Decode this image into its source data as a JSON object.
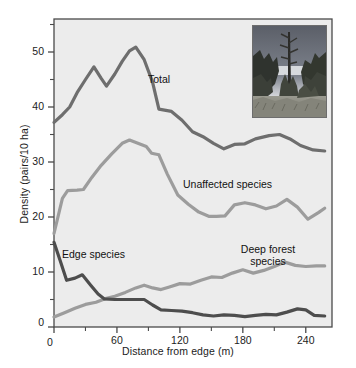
{
  "figure": {
    "background_color": "#ffffff",
    "plot_background_color": "#ececec",
    "frame_color": "#4a4a4a"
  },
  "axes": {
    "y_title": "Density (pairs/10 ha)",
    "x_title": "Distance from edge (m)",
    "y_ticks": [
      0,
      10,
      20,
      30,
      40,
      50
    ],
    "y_tick_labels": [
      "0",
      "10",
      "20",
      "30",
      "40",
      "50"
    ],
    "y_minor_ticks": [
      5,
      15,
      25,
      35,
      45,
      55
    ],
    "x_ticks": [
      0,
      60,
      120,
      180,
      240
    ],
    "x_tick_labels": [
      "0",
      "60",
      "120",
      "180",
      "240"
    ],
    "x_minor_ticks": [
      30,
      90,
      150,
      210
    ],
    "ylim": [
      0,
      56
    ],
    "xlim": [
      0,
      265
    ]
  },
  "series_labels": {
    "total": "Total",
    "unaffected": "Unaffected species",
    "deep_forest_line1": "Deep forest",
    "deep_forest_line2": "species",
    "edge": "Edge species"
  },
  "inset": {
    "name": "forest-edge-photograph",
    "description": "Black and white photograph of a forest edge with a tall dead snag tree"
  },
  "chart_data": {
    "type": "line",
    "title": "",
    "xlabel": "Distance from edge (m)",
    "ylabel": "Density (pairs/10 ha)",
    "xlim": [
      0,
      265
    ],
    "ylim": [
      0,
      56
    ],
    "grid": false,
    "legend": "inline-labels",
    "series": [
      {
        "name": "Total",
        "color": "#6e6e6e",
        "width": 3.2,
        "points": [
          [
            0,
            37.2
          ],
          [
            8,
            38.6
          ],
          [
            15,
            40.0
          ],
          [
            22,
            42.6
          ],
          [
            30,
            45.0
          ],
          [
            38,
            47.3
          ],
          [
            45,
            45.2
          ],
          [
            50,
            43.8
          ],
          [
            58,
            46.0
          ],
          [
            65,
            48.3
          ],
          [
            72,
            50.2
          ],
          [
            78,
            50.9
          ],
          [
            86,
            48.6
          ],
          [
            94,
            44.5
          ],
          [
            100,
            39.6
          ],
          [
            112,
            39.2
          ],
          [
            122,
            37.6
          ],
          [
            132,
            35.5
          ],
          [
            142,
            34.6
          ],
          [
            152,
            33.4
          ],
          [
            162,
            32.4
          ],
          [
            172,
            33.2
          ],
          [
            182,
            33.3
          ],
          [
            192,
            34.2
          ],
          [
            205,
            34.8
          ],
          [
            215,
            35.0
          ],
          [
            225,
            34.2
          ],
          [
            235,
            33.0
          ],
          [
            247,
            32.2
          ],
          [
            258,
            32.0
          ]
        ]
      },
      {
        "name": "Unaffected species",
        "color": "#9c9c9c",
        "width": 3.2,
        "points": [
          [
            0,
            17.0
          ],
          [
            8,
            23.4
          ],
          [
            13,
            24.8
          ],
          [
            22,
            24.9
          ],
          [
            28,
            25.0
          ],
          [
            36,
            27.2
          ],
          [
            45,
            29.4
          ],
          [
            55,
            31.5
          ],
          [
            65,
            33.4
          ],
          [
            72,
            34.0
          ],
          [
            80,
            33.4
          ],
          [
            88,
            32.8
          ],
          [
            93,
            31.6
          ],
          [
            100,
            31.3
          ],
          [
            108,
            27.8
          ],
          [
            118,
            24.0
          ],
          [
            128,
            22.3
          ],
          [
            138,
            20.9
          ],
          [
            148,
            20.1
          ],
          [
            155,
            20.1
          ],
          [
            163,
            20.2
          ],
          [
            172,
            22.2
          ],
          [
            182,
            22.6
          ],
          [
            192,
            22.2
          ],
          [
            202,
            21.5
          ],
          [
            212,
            22.0
          ],
          [
            222,
            23.2
          ],
          [
            232,
            21.8
          ],
          [
            242,
            19.6
          ],
          [
            252,
            20.8
          ],
          [
            258,
            21.6
          ]
        ]
      },
      {
        "name": "Deep forest species",
        "color": "#9c9c9c",
        "width": 3.2,
        "points": [
          [
            0,
            1.8
          ],
          [
            10,
            2.6
          ],
          [
            20,
            3.4
          ],
          [
            30,
            4.1
          ],
          [
            40,
            4.5
          ],
          [
            48,
            5.1
          ],
          [
            58,
            5.6
          ],
          [
            68,
            6.3
          ],
          [
            78,
            7.1
          ],
          [
            86,
            7.6
          ],
          [
            94,
            7.1
          ],
          [
            102,
            6.8
          ],
          [
            110,
            7.3
          ],
          [
            120,
            7.9
          ],
          [
            130,
            7.8
          ],
          [
            140,
            8.5
          ],
          [
            150,
            9.1
          ],
          [
            160,
            9.0
          ],
          [
            170,
            9.8
          ],
          [
            180,
            10.4
          ],
          [
            190,
            9.8
          ],
          [
            200,
            10.3
          ],
          [
            210,
            11.0
          ],
          [
            220,
            11.8
          ],
          [
            230,
            11.2
          ],
          [
            240,
            11.0
          ],
          [
            250,
            11.1
          ],
          [
            258,
            11.1
          ]
        ]
      },
      {
        "name": "Edge species",
        "color": "#4d4d4d",
        "width": 3.2,
        "points": [
          [
            0,
            15.4
          ],
          [
            6,
            12.0
          ],
          [
            12,
            8.5
          ],
          [
            20,
            8.9
          ],
          [
            27,
            9.5
          ],
          [
            35,
            7.6
          ],
          [
            42,
            6.0
          ],
          [
            48,
            5.1
          ],
          [
            58,
            5.0
          ],
          [
            68,
            5.0
          ],
          [
            78,
            5.0
          ],
          [
            86,
            5.0
          ],
          [
            94,
            4.0
          ],
          [
            102,
            3.1
          ],
          [
            112,
            3.0
          ],
          [
            122,
            2.9
          ],
          [
            132,
            2.6
          ],
          [
            142,
            2.2
          ],
          [
            152,
            2.0
          ],
          [
            162,
            2.2
          ],
          [
            172,
            2.1
          ],
          [
            182,
            1.9
          ],
          [
            192,
            2.1
          ],
          [
            202,
            2.3
          ],
          [
            212,
            2.2
          ],
          [
            222,
            2.7
          ],
          [
            232,
            3.3
          ],
          [
            240,
            3.1
          ],
          [
            248,
            2.1
          ],
          [
            258,
            2.0
          ]
        ]
      }
    ]
  }
}
